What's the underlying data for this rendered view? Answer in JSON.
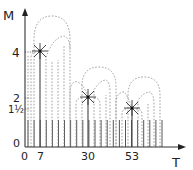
{
  "diagram": {
    "y_axis_label": "M",
    "x_axis_label": "T",
    "y_ticks": [
      {
        "label": "4",
        "value": 4
      },
      {
        "label": "2",
        "value": 2
      },
      {
        "label": "1½",
        "value": 1.5
      },
      {
        "label": "0",
        "value": 0
      }
    ],
    "x_ticks": [
      {
        "label": "0",
        "value": 0
      },
      {
        "label": "7",
        "value": 7
      },
      {
        "label": "30",
        "value": 30
      },
      {
        "label": "53",
        "value": 53
      }
    ],
    "peaks": [
      {
        "t": 7,
        "m": 4,
        "marker": "star"
      },
      {
        "t": 30,
        "m": 2,
        "marker": "star"
      },
      {
        "t": 53,
        "m": 1.5,
        "marker": "star"
      }
    ],
    "bar_height": 1,
    "bar_count": 23
  }
}
